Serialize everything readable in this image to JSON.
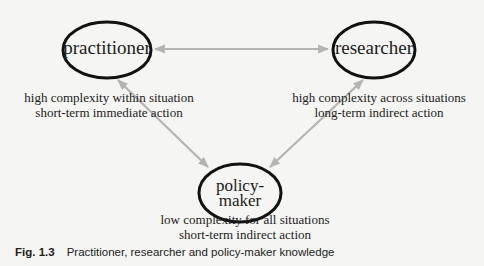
{
  "colors": {
    "background": "#f5f5f3",
    "ellipse_stroke": "#111111",
    "arrow": "#b4b4b4",
    "text": "#1c1c1c"
  },
  "nodes": {
    "practitioner": {
      "label": "practitioner",
      "description": [
        "high complexity within situation",
        "short-term immediate action"
      ]
    },
    "researcher": {
      "label": "researcher",
      "description": [
        "high complexity across situations",
        "long-term indirect action"
      ]
    },
    "policy_maker": {
      "label_lines": [
        "policy-",
        "maker"
      ],
      "description": [
        "low complexity for all situations",
        "short-term indirect action"
      ]
    }
  },
  "edges": [
    {
      "from": "practitioner",
      "to": "researcher",
      "type": "bidirectional"
    },
    {
      "from": "practitioner",
      "to": "policy_maker",
      "type": "bidirectional"
    },
    {
      "from": "researcher",
      "to": "policy_maker",
      "type": "bidirectional"
    }
  ],
  "caption": {
    "figure_number": "Fig. 1.3",
    "text": "Practitioner, researcher and policy-maker knowledge"
  }
}
